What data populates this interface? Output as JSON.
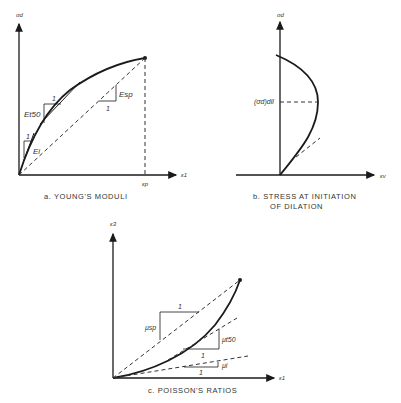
{
  "panels": {
    "a": {
      "caption": "a.   YOUNG'S MODULI",
      "y_axis_label": "σd",
      "x_axis_label": "ε1",
      "x_marker_label": "εp",
      "annotations": {
        "initial_modulus": "Ei",
        "tangent_modulus_50": "Et50",
        "secant_modulus": "Esp",
        "unit_initial": "1",
        "unit_tangent": "1",
        "unit_secant": "1"
      }
    },
    "b": {
      "caption_line1": "b.   STRESS AT INITIATION",
      "caption_line2": "OF DILATION",
      "y_axis_label": "σd",
      "x_axis_label": "εv",
      "annotations": {
        "dilation_stress": "(σd)dil"
      }
    },
    "c": {
      "caption": "c.   POISSON'S RATIOS",
      "y_axis_label": "ε3",
      "x_axis_label": "ε1",
      "annotations": {
        "secant_ratio": "μsp",
        "tangent_ratio_50": "μt50",
        "initial_ratio": "μi",
        "unit_secant": "1",
        "unit_tangent": "1",
        "unit_initial": "1"
      }
    }
  },
  "colors": {
    "line": "#1a1a1a",
    "dashed": "#333333",
    "text": "#333333"
  }
}
